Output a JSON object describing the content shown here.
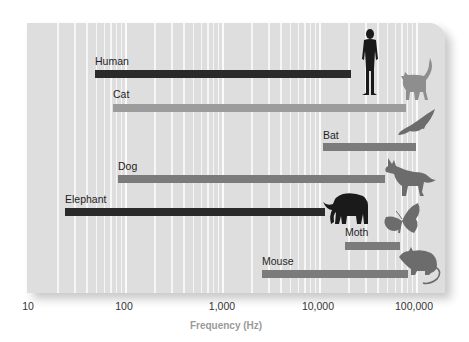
{
  "chart_data": {
    "type": "bar",
    "orientation": "horizontal-range",
    "title": "",
    "xlabel": "Frequency (Hz)",
    "ylabel": "",
    "xscale": "log",
    "xlim": [
      10,
      150000
    ],
    "x_ticks": [
      10,
      100,
      1000,
      10000,
      100000
    ],
    "x_tick_labels": [
      "10",
      "100",
      "1,000",
      "10,000",
      "100,000"
    ],
    "grid": "vertical minor log gridlines (white)",
    "legend": "none; each bar labeled with animal name and silhouette icon",
    "categories": [
      "Human",
      "Cat",
      "Bat",
      "Dog",
      "Elephant",
      "Moth",
      "Mouse"
    ],
    "series": [
      {
        "name": "Hearing range",
        "ranges": [
          {
            "label": "Human",
            "min": 50,
            "max": 20000,
            "color": "#2a2a2a",
            "icon": "human-icon"
          },
          {
            "label": "Cat",
            "min": 75,
            "max": 80000,
            "color": "#9c9c9c",
            "icon": "cat-icon"
          },
          {
            "label": "Bat",
            "min": 11000,
            "max": 100000,
            "color": "#7b7b7b",
            "icon": "bat-icon"
          },
          {
            "label": "Dog",
            "min": 85,
            "max": 45000,
            "color": "#7b7b7b",
            "icon": "dog-icon"
          },
          {
            "label": "Elephant",
            "min": 25,
            "max": 11000,
            "color": "#2a2a2a",
            "icon": "elephant-icon"
          },
          {
            "label": "Moth",
            "min": 19000,
            "max": 70000,
            "color": "#7b7b7b",
            "icon": "moth-icon"
          },
          {
            "label": "Mouse",
            "min": 2600,
            "max": 85000,
            "color": "#7b7b7b",
            "icon": "mouse-icon"
          }
        ]
      }
    ]
  },
  "labels": {
    "human": "Human",
    "cat": "Cat",
    "bat": "Bat",
    "dog": "Dog",
    "elephant": "Elephant",
    "moth": "Moth",
    "mouse": "Mouse"
  },
  "axis": {
    "ticks": [
      "10",
      "100",
      "1,000",
      "10,000",
      "100,000"
    ],
    "xlabel": "Frequency (Hz)"
  },
  "colors": {
    "panel_bg": "#dedede",
    "gridline": "#f6f6f6",
    "dark_bar": "#2a2a2a",
    "light_bar": "#9c9c9c",
    "medium_bar": "#7b7b7b",
    "axis_title": "#9a9a9a"
  }
}
